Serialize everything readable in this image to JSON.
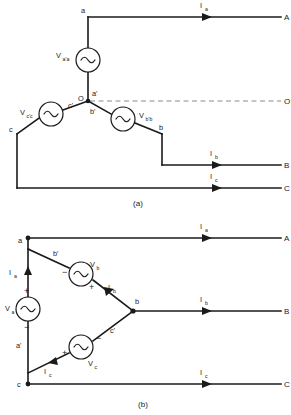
{
  "figure": {
    "background_color": "#ffffff",
    "line_color": "#1a1a1a",
    "dashed_color": "#8a8a8a"
  },
  "panel_a": {
    "caption": "(a)",
    "description": "Wye (star) connected three-phase voltage source",
    "sources": [
      {
        "id": "src-aa",
        "label_main": "V",
        "label_sub": "a'a"
      },
      {
        "id": "src-cc",
        "label_main": "V",
        "label_sub": "c'c"
      },
      {
        "id": "src-bb",
        "label_main": "V",
        "label_sub": "b'b"
      }
    ],
    "node_labels": [
      {
        "id": "node-a",
        "text": "a"
      },
      {
        "id": "node-a-prime",
        "text": "a'"
      },
      {
        "id": "node-b",
        "text": "b"
      },
      {
        "id": "node-b-prime",
        "text": "b'"
      },
      {
        "id": "node-c",
        "text": "c"
      },
      {
        "id": "node-c-prime",
        "text": "c'"
      },
      {
        "id": "node-neutral",
        "text": "O"
      }
    ],
    "currents": [
      {
        "id": "current-a",
        "label_main": "I",
        "label_sub": "a"
      },
      {
        "id": "current-b",
        "label_main": "I",
        "label_sub": "b"
      },
      {
        "id": "current-c",
        "label_main": "I",
        "label_sub": "c"
      }
    ],
    "terminals": [
      {
        "id": "terminal-A",
        "text": "A"
      },
      {
        "id": "terminal-B",
        "text": "B"
      },
      {
        "id": "terminal-C",
        "text": "C"
      },
      {
        "id": "terminal-O",
        "text": "O"
      }
    ]
  },
  "panel_b": {
    "caption": "(b)",
    "description": "Delta connected three-phase voltage source",
    "sources": [
      {
        "id": "src-va",
        "label_main": "V",
        "label_sub": "a",
        "plus": "+",
        "minus": "−"
      },
      {
        "id": "src-vb",
        "label_main": "V",
        "label_sub": "b",
        "plus": "+",
        "minus": "−"
      },
      {
        "id": "src-vc",
        "label_main": "V",
        "label_sub": "c",
        "plus": "+",
        "minus": "−"
      }
    ],
    "node_labels": [
      {
        "id": "node-a",
        "text": "a"
      },
      {
        "id": "node-a-prime",
        "text": "a'"
      },
      {
        "id": "node-b",
        "text": "b"
      },
      {
        "id": "node-b-prime",
        "text": "b'"
      },
      {
        "id": "node-c",
        "text": "c"
      },
      {
        "id": "node-c-prime",
        "text": "c'"
      }
    ],
    "currents": [
      {
        "id": "current-a-inner",
        "label_main": "I",
        "label_sub": "a"
      },
      {
        "id": "current-b-inner",
        "label_main": "I",
        "label_sub": "b"
      },
      {
        "id": "current-c-inner",
        "label_main": "I",
        "label_sub": "c"
      },
      {
        "id": "current-a-line",
        "label_main": "I",
        "label_sub": "a"
      },
      {
        "id": "current-b-line",
        "label_main": "I",
        "label_sub": "b"
      },
      {
        "id": "current-c-line",
        "label_main": "I",
        "label_sub": "c"
      }
    ],
    "terminals": [
      {
        "id": "terminal-A",
        "text": "A"
      },
      {
        "id": "terminal-B",
        "text": "B"
      },
      {
        "id": "terminal-C",
        "text": "C"
      }
    ]
  }
}
